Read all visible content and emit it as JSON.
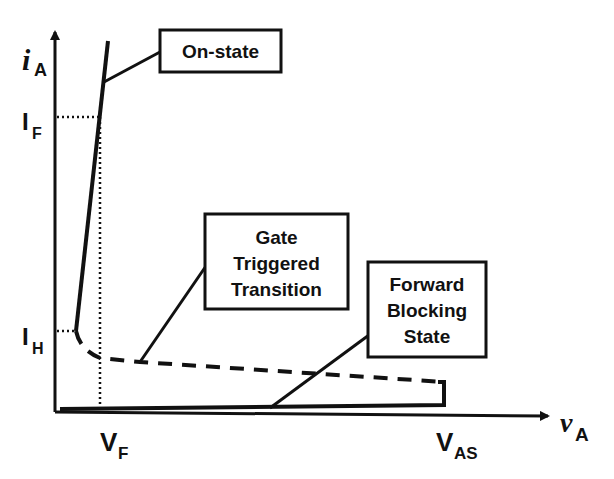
{
  "diagram": {
    "y_axis": {
      "symbol": "i",
      "subscript": "A"
    },
    "x_axis": {
      "symbol": "v",
      "subscript": "A"
    },
    "y_ticks": [
      {
        "main": "I",
        "subscript": "F"
      },
      {
        "main": "I",
        "subscript": "H"
      }
    ],
    "x_ticks": [
      {
        "main": "V",
        "subscript": "F"
      },
      {
        "main": "V",
        "subscript": "AS"
      }
    ],
    "callouts": {
      "on_state": [
        "On-state"
      ],
      "gate_triggered": [
        "Gate",
        "Triggered",
        "Transition"
      ],
      "forward_blocking": [
        "Forward",
        "Blocking",
        "State"
      ]
    },
    "colors": {
      "ink": "#111111",
      "background": "#ffffff"
    }
  }
}
